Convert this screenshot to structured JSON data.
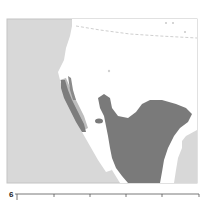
{
  "figure": {
    "type": "distribution-map",
    "region": "southwestern North America / Mexico",
    "colors": {
      "ocean": "#d6d6d6",
      "land": "#ffffff",
      "distribution": "#7a7a7a",
      "border": "#cfcfcf",
      "frame": "#bdbdbd"
    }
  },
  "lower_chart": {
    "y_tick_top": "6",
    "x_tick_count": 6
  }
}
